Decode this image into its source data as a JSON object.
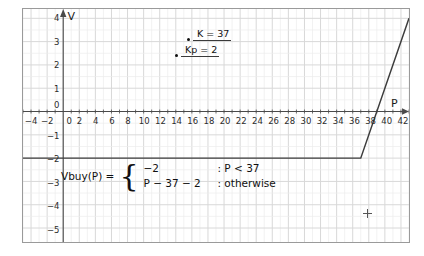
{
  "chart_data": {
    "type": "line",
    "title": "",
    "xlabel": "P",
    "ylabel": "V",
    "xlim": [
      -5,
      43
    ],
    "ylim": [
      -5.6,
      4.4
    ],
    "grid": true,
    "legend_position": "none",
    "x_ticks": [
      -4,
      -2,
      0,
      2,
      4,
      6,
      8,
      10,
      12,
      14,
      16,
      18,
      20,
      22,
      24,
      26,
      28,
      30,
      32,
      34,
      36,
      38,
      40,
      42
    ],
    "y_ticks": [
      4,
      3,
      2,
      1,
      0,
      -1,
      -2,
      -3,
      -4,
      -5
    ],
    "series": [
      {
        "name": "Vbuy(P)",
        "points": [
          {
            "x": -5,
            "y": -2
          },
          {
            "x": 37,
            "y": -2
          },
          {
            "x": 43,
            "y": 4
          }
        ]
      }
    ],
    "annotations": [
      {
        "id": "k",
        "label": "K = 37",
        "value": 37
      },
      {
        "id": "kp",
        "label": "Kp = 2",
        "value": 2
      }
    ],
    "formula": {
      "lhs": "Vbuy(P)",
      "equals": "=",
      "brace": "{",
      "cases": [
        {
          "expr": "−2",
          "cond": ": P < 37"
        },
        {
          "expr": "P − 37 − 2",
          "cond": ": otherwise"
        }
      ]
    }
  },
  "axes": {
    "y_axis_label": "V",
    "x_axis_label": "P"
  },
  "markers": {
    "cursor": "+"
  },
  "colors": {
    "curve": "#3c3c3c",
    "axis": "#4a4a4a",
    "grid_major": "#d8d8d8",
    "grid_minor": "#ececec",
    "text": "#1a1a1a",
    "frame": "#9a9a9a",
    "background": "#ffffff"
  }
}
